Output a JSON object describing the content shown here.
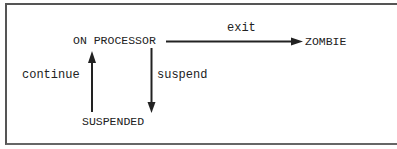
{
  "diagram": {
    "type": "state-transition",
    "states": {
      "on_processor": "ON PROCESSOR",
      "zombie": "ZOMBIE",
      "suspended": "SUSPENDED"
    },
    "transitions": {
      "exit": "exit",
      "suspend": "suspend",
      "continue": "continue"
    },
    "edges": [
      {
        "from": "ON PROCESSOR",
        "to": "ZOMBIE",
        "label": "exit"
      },
      {
        "from": "ON PROCESSOR",
        "to": "SUSPENDED",
        "label": "suspend"
      },
      {
        "from": "SUSPENDED",
        "to": "ON PROCESSOR",
        "label": "continue"
      }
    ],
    "colors": {
      "line": "#222222",
      "border": "#555555",
      "background": "#ffffff"
    }
  }
}
